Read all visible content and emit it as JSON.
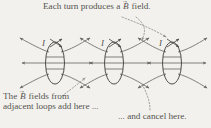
{
  "figure": {
    "title_caption": {
      "text_before": "Each turn produces a",
      "vector_symbol": "B",
      "vector_arrow": "→",
      "text_after": "field."
    },
    "bottom_left_caption": {
      "line1_before": "The",
      "vector_symbol": "B",
      "vector_arrow": "→",
      "line1_after": "fields from",
      "line2": "adjacent loops add here ..."
    },
    "bottom_right_caption": {
      "text": "... and cancel here."
    },
    "current_labels": [
      "I",
      "I",
      "I"
    ],
    "loops": [
      {
        "name": "loop-1",
        "cx": 55,
        "cy": 63,
        "rx": 9.5,
        "ry": 21
      },
      {
        "name": "loop-2",
        "cx": 114,
        "cy": 63,
        "rx": 9.5,
        "ry": 21
      },
      {
        "name": "loop-3",
        "cx": 172,
        "cy": 63,
        "rx": 9.5,
        "ry": 21
      }
    ],
    "colors": {
      "background": "#f2f1ee",
      "ink": "#56544f",
      "field_line": "#6e6c67",
      "loop_line": "#4f4d49",
      "leader_dotted": "#8b8984"
    },
    "axis_y": 63,
    "field_line_count_per_loop": 5,
    "leader_lines": [
      {
        "name": "leader-top-to-loop3",
        "from": "top-caption",
        "to": "loop-3-region"
      },
      {
        "name": "leader-top-to-gap23",
        "from": "top-caption",
        "to": "between-loop-2-and-3"
      },
      {
        "name": "leader-addhere-to-gap12",
        "from": "bottom-left-caption",
        "to": "between-loop-1-and-2"
      },
      {
        "name": "leader-cancelhere-to-gap23",
        "from": "bottom-right-caption",
        "to": "between-loop-2-and-3"
      }
    ]
  }
}
